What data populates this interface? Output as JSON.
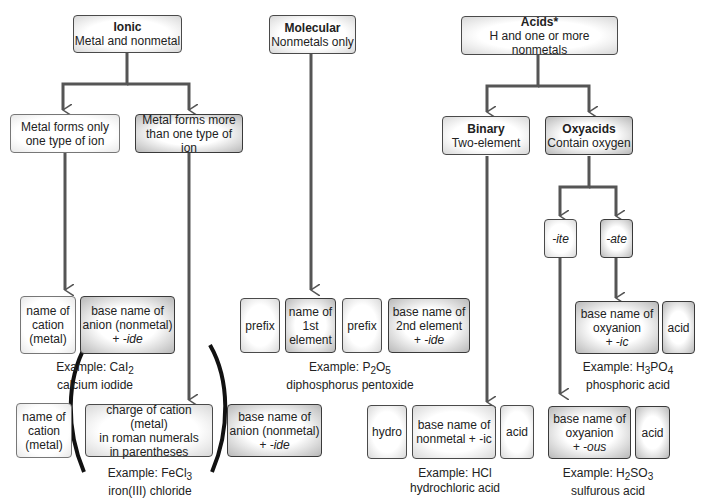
{
  "ionic": {
    "title": "Ionic",
    "subtitle": "Metal and nonmetal",
    "one_type": "Metal forms only one type of ion",
    "more_types": "Metal forms more than one type of ion",
    "one_type_parts": {
      "cation": [
        "name of",
        "cation",
        "(metal)"
      ],
      "anion": [
        "base name of",
        "anion (nonmetal)",
        "+ -ide"
      ]
    },
    "one_type_example": {
      "prefix": "Example: CaI",
      "sub": "2",
      "name": "calcium iodide"
    },
    "more_types_parts": {
      "cation": [
        "name of",
        "cation",
        "(metal)"
      ],
      "charge": [
        "charge of cation (metal)",
        "in roman numerals",
        "in parentheses"
      ],
      "anion": [
        "base name of",
        "anion (nonmetal)",
        "+ -ide"
      ]
    },
    "more_types_example": {
      "prefix": "Example: FeCl",
      "sub": "3",
      "name": "iron(III) chloride"
    }
  },
  "molecular": {
    "title": "Molecular",
    "subtitle": "Nonmetals only",
    "parts": {
      "prefix1": "prefix",
      "first": [
        "name of",
        "1st",
        "element"
      ],
      "prefix2": "prefix",
      "second": [
        "base name of",
        "2nd element",
        "+ -ide"
      ]
    },
    "example": {
      "pre": "Example: P",
      "s1": "2",
      "mid": "O",
      "s2": "5",
      "name": "diphosphorus pentoxide"
    }
  },
  "acids": {
    "title": "Acids*",
    "subtitle": "H and one or more nonmetals",
    "binary": {
      "title": "Binary",
      "subtitle": "Two-element",
      "parts": {
        "hydro": "hydro",
        "base": [
          "base name of",
          "nonmetal + -ic"
        ],
        "acid": "acid"
      },
      "example": {
        "text": "Example: HCl",
        "name": "hydrochloric acid"
      }
    },
    "oxyacids": {
      "title": "Oxyacids",
      "subtitle": "Contain oxygen",
      "ite": "-ite",
      "ate": "-ate",
      "ic_parts": {
        "base": [
          "base name of",
          "oxyanion",
          "+ -ic"
        ],
        "acid": "acid"
      },
      "ic_example": {
        "pre": "Example: H",
        "s1": "3",
        "mid": "PO",
        "s2": "4",
        "name": "phosphoric acid"
      },
      "ous_parts": {
        "base": [
          "base name of",
          "oxyanion",
          "+ -ous"
        ],
        "acid": "acid"
      },
      "ous_example": {
        "pre": "Example: H",
        "s1": "2",
        "mid": "SO",
        "s2": "3",
        "name": "sulfurous acid"
      }
    }
  }
}
